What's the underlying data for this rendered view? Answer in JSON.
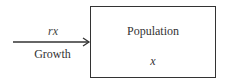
{
  "diagram": {
    "stock": {
      "title": "Population",
      "variable": "x"
    },
    "flow": {
      "rate": "rx",
      "label": "Growth"
    }
  }
}
